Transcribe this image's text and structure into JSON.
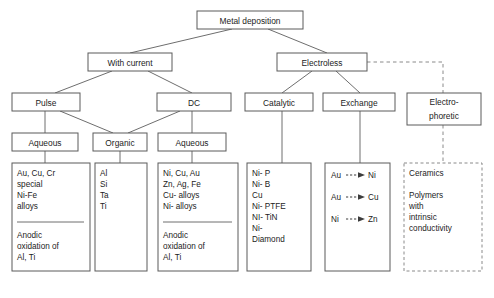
{
  "diagram": {
    "title": "Metal deposition",
    "root": {
      "label": "Metal deposition"
    },
    "level2": {
      "with_current": "With current",
      "electroless": "Electroless"
    },
    "level3": {
      "pulse": "Pulse",
      "dc": "DC",
      "catalytic": "Catalytic",
      "exchange": "Exchange",
      "electrophoretic_line1": "Electro-",
      "electrophoretic_line2": "phoretic"
    },
    "level4": {
      "aqueous_pulse": "Aqueous",
      "organic": "Organic",
      "aqueous_dc": "Aqueous"
    },
    "lists": {
      "aqueous_pulse": {
        "top": [
          "Au, Cu, Cr",
          "special",
          "Ni-Fe",
          "alloys"
        ],
        "bottom": [
          "Anodic",
          "oxidation of",
          "Al, Ti"
        ]
      },
      "organic": {
        "top": [
          "Al",
          "Si",
          "Ta",
          "Ti"
        ],
        "bottom": []
      },
      "aqueous_dc": {
        "top": [
          "Ni, Cu, Au",
          "Zn, Ag, Fe",
          "Cu- alloys",
          "Ni- alloys"
        ],
        "bottom": [
          "Anodic",
          "oxidation of",
          "Al, Ti"
        ]
      },
      "catalytic": {
        "top": [
          "Ni- P",
          "Ni- B",
          "Cu",
          "Ni- PTFE",
          "NI- TiN",
          "Ni-",
          "Diamond"
        ],
        "bottom": []
      },
      "exchange_pairs": [
        {
          "from": "Au",
          "to": "Ni"
        },
        {
          "from": "Au",
          "to": "Cu"
        },
        {
          "from": "Ni",
          "to": "Zn"
        }
      ],
      "electrophoretic": {
        "top": [
          "Ceramics"
        ],
        "bottom": [
          "Polymers",
          "with",
          "intrinsic",
          "conductivity"
        ]
      }
    },
    "colors": {
      "box_stroke": "#5a5a5a",
      "dashed_stroke": "#8a8a8a",
      "connector": "#6e6e6e",
      "text": "#1c1c1c",
      "background": "#ffffff"
    }
  },
  "caption": {
    "text": ""
  }
}
